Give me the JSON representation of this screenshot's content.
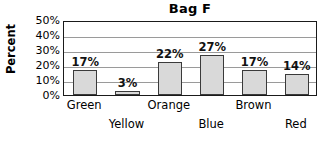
{
  "chart_data": {
    "type": "bar",
    "title": "Bag F",
    "xlabel": "",
    "ylabel": "Percent",
    "categories": [
      "Green",
      "Yellow",
      "Orange",
      "Blue",
      "Brown",
      "Red"
    ],
    "values": [
      17,
      3,
      22,
      27,
      17,
      14
    ],
    "value_labels": [
      "17%",
      "3%",
      "22%",
      "27%",
      "17%",
      "14%"
    ],
    "ylim": [
      0,
      50
    ],
    "ytick_labels": [
      "50%",
      "40%",
      "30%",
      "20%",
      "10%",
      "0%"
    ],
    "ytick_values": [
      50,
      40,
      30,
      20,
      10,
      0
    ],
    "grid": true,
    "legend": "none",
    "bar_fill_color": "#d9d9d9",
    "bar_border_color": "#3a3a3a",
    "gridline_color": "#9a9a9a",
    "plot_border_color": "#1a1a1a",
    "background_color": "#ffffff",
    "xlabel_layout": "staggered-two-rows"
  }
}
